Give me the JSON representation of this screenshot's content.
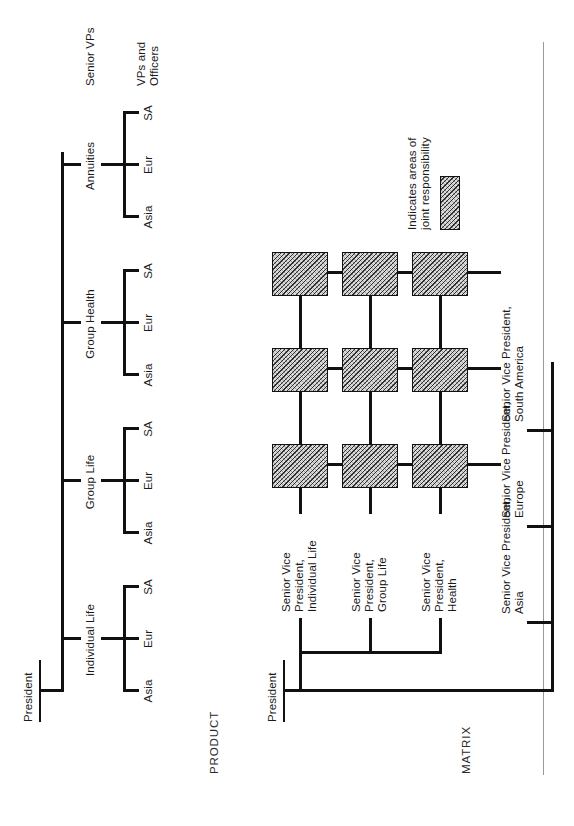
{
  "figure": {
    "sections": [
      {
        "id": "product",
        "label": "PRODUCT"
      },
      {
        "id": "matrix",
        "label": "MATRIX"
      }
    ]
  },
  "product_chart": {
    "section_label": "PRODUCT",
    "root": "President",
    "level_annotations": [
      "Senior VPs",
      "VPs and\nOfficers"
    ],
    "level_annotation_1": "Senior VPs",
    "level_annotation_2": "VPs and",
    "level_annotation_2b": "Officers",
    "divisions": [
      {
        "label": "Individual Life",
        "children": [
          "Asia",
          "Eur",
          "SA"
        ]
      },
      {
        "label": "Group Life",
        "children": [
          "Asia",
          "Eur",
          "SA"
        ]
      },
      {
        "label": "Group Health",
        "children": [
          "Asia",
          "Eur",
          "SA"
        ]
      },
      {
        "label": "Annuities",
        "children": [
          "Asia",
          "Eur",
          "SA"
        ]
      }
    ]
  },
  "matrix_chart": {
    "section_label": "MATRIX",
    "root": "President",
    "product_columns": [
      {
        "line1": "Senior Vice",
        "line2": "President,",
        "line3": "Individual Life",
        "full": "Senior Vice President, Individual Life"
      },
      {
        "line1": "Senior Vice",
        "line2": "President,",
        "line3": "Group Life",
        "full": "Senior Vice President, Group Life"
      },
      {
        "line1": "Senior Vice",
        "line2": "President,",
        "line3": "Health",
        "full": "Senior Vice President, Health"
      }
    ],
    "region_rows": [
      {
        "line1": "Senior Vice President,",
        "line2": "Asia",
        "full": "Senior Vice President, Asia"
      },
      {
        "line1": "Senior Vice President,",
        "line2": "Europe",
        "full": "Senior Vice President, Europe"
      },
      {
        "line1": "Senior Vice President,",
        "line2": "South America",
        "full": "Senior Vice President, South America"
      }
    ],
    "intersections": [
      [
        "joint",
        "joint",
        "joint"
      ],
      [
        "joint",
        "joint",
        "joint"
      ],
      [
        "joint",
        "joint",
        "joint"
      ]
    ]
  },
  "legend": {
    "line1": "Indicates areas of",
    "line2": "joint responsibility",
    "full": "Indicates areas of joint responsibility",
    "swatch": "hatched-box"
  },
  "colors": {
    "ink": "#111111",
    "text": "#1a1a1a",
    "hatch_fill": "#d9d9d9",
    "divider": "#9a9a9a",
    "background": "#ffffff"
  }
}
